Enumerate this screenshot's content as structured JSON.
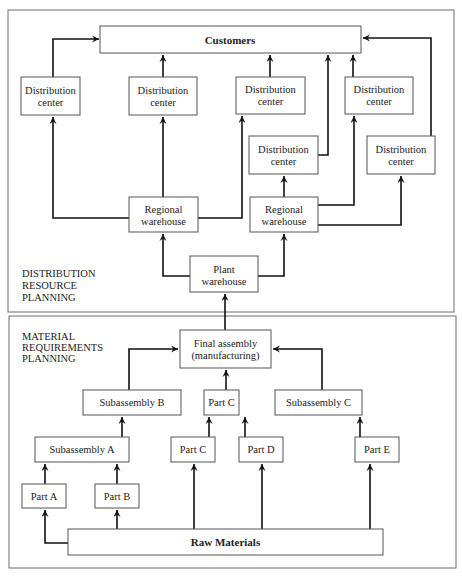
{
  "drp": {
    "section_label": [
      "DISTRIBUTION",
      "RESOURCE",
      "PLANNING"
    ],
    "customers": "Customers",
    "distribution_centers": [
      [
        "Distribution",
        "center"
      ],
      [
        "Distribution",
        "center"
      ],
      [
        "Distribution",
        "center"
      ],
      [
        "Distribution",
        "center"
      ],
      [
        "Distribution",
        "center"
      ],
      [
        "Distribution",
        "center"
      ]
    ],
    "regional_warehouses": [
      [
        "Regional",
        "warehouse"
      ],
      [
        "Regional",
        "warehouse"
      ]
    ],
    "plant_warehouse": [
      "Plant",
      "warehouse"
    ]
  },
  "mrp": {
    "section_label": [
      "MATERIAL",
      "REQUIREMENTS",
      "PLANNING"
    ],
    "final_assembly": [
      "Final assembly",
      "(manufacturing)"
    ],
    "level2": [
      "Subassembly B",
      "Part C",
      "Subassembly C"
    ],
    "level3": [
      "Subassembly A",
      "Part C",
      "Part D",
      "Part E"
    ],
    "level4": [
      "Part A",
      "Part B"
    ],
    "raw_materials": "Raw Materials"
  }
}
